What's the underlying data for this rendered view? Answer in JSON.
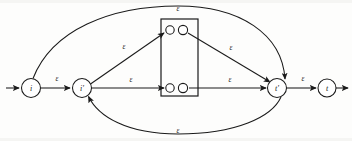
{
  "figure": {
    "type": "finite-automaton-diagram",
    "ink_color": "#1a1a1a",
    "background_color": "#fdfdfc"
  },
  "nodes": [
    {
      "id": "i",
      "label": "i",
      "cx": 31,
      "cy": 88,
      "r": 9.5
    },
    {
      "id": "i-prime",
      "label": "i'",
      "cx": 82,
      "cy": 88,
      "r": 9.5
    },
    {
      "id": "t-prime",
      "label": "t'",
      "cx": 277,
      "cy": 88,
      "r": 9.5
    },
    {
      "id": "t",
      "label": "t",
      "cx": 327,
      "cy": 88,
      "r": 9.0
    }
  ],
  "inner_box": {
    "x": 161,
    "y": 19,
    "width": 37,
    "height": 77,
    "states": [
      {
        "id": "inner-top-left",
        "cx": 170,
        "cy": 30,
        "r": 4.2
      },
      {
        "id": "inner-top-right",
        "cx": 183,
        "cy": 30,
        "r": 4.6
      },
      {
        "id": "inner-bottom-left",
        "cx": 170,
        "cy": 88,
        "r": 4.2
      },
      {
        "id": "inner-bottom-right",
        "cx": 183,
        "cy": 88,
        "r": 4.6
      }
    ]
  },
  "edges": [
    {
      "id": "entry-arrow",
      "label": "",
      "from": "start",
      "to": "i"
    },
    {
      "id": "i-to-iprime",
      "label": "ε",
      "from": "i",
      "to": "i-prime",
      "label_x": 57,
      "label_y": 79
    },
    {
      "id": "iprime-to-innertop",
      "label": "ε",
      "from": "i-prime",
      "to": "inner-top-left",
      "label_x": 124,
      "label_y": 47
    },
    {
      "id": "iprime-to-innerbot",
      "label": "ε",
      "from": "i-prime",
      "to": "inner-bottom-left",
      "label_x": 131,
      "label_y": 80
    },
    {
      "id": "innertop-to-tprime",
      "label": "ε",
      "from": "inner-top-right",
      "to": "t-prime",
      "label_x": 231,
      "label_y": 48
    },
    {
      "id": "innerbot-to-tprime",
      "label": "ε",
      "from": "inner-bottom-right",
      "to": "t-prime",
      "label_x": 230,
      "label_y": 80
    },
    {
      "id": "tprime-to-t",
      "label": "ε",
      "from": "t-prime",
      "to": "t",
      "label_x": 303,
      "label_y": 79
    },
    {
      "id": "bypass-top",
      "label": "ε",
      "from": "i",
      "to": "t-prime",
      "label_x": 178,
      "label_y": 9
    },
    {
      "id": "bypass-bottom",
      "label": "ε",
      "from": "t-prime",
      "to": "i-prime",
      "label_x": 178,
      "label_y": 131
    },
    {
      "id": "exit-arrow",
      "label": "",
      "from": "t",
      "to": "end"
    }
  ],
  "epsilon_symbol": "ε"
}
